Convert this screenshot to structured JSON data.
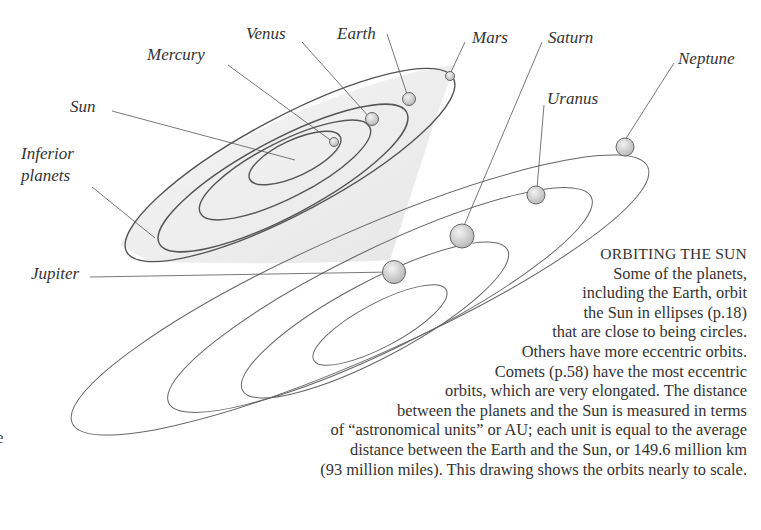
{
  "diagram": {
    "labels": {
      "sun": "Sun",
      "mercury": "Mercury",
      "venus": "Venus",
      "earth": "Earth",
      "mars": "Mars",
      "jupiter": "Jupiter",
      "saturn": "Saturn",
      "uranus": "Uranus",
      "neptune": "Neptune",
      "inferior_line1": "Inferior",
      "inferior_line2": "planets"
    },
    "colors": {
      "orbit_line": "#555555",
      "planet_fill": "#cfcfcf",
      "shadow": "#e8e8e8",
      "text": "#333333"
    }
  },
  "caption": {
    "title": "ORBITING THE SUN",
    "lines": [
      "Some of the planets,",
      "including the Earth, orbit",
      "the Sun in ellipses (p.18)",
      "that are close to being circles.",
      "Others have more eccentric orbits.",
      "Comets (p.58) have the most eccentric",
      "orbits, which are very elongated. The distance",
      "between the planets and the Sun is measured in terms",
      "of “astronomical units” or AU; each unit is equal to the average",
      "distance between the Earth and the Sun, or 149.6 million km",
      "(93 million miles). This drawing shows the orbits nearly to scale."
    ]
  },
  "margin_fragment": "e"
}
